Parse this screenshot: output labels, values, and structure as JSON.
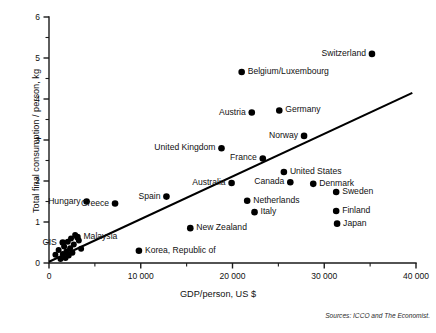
{
  "chart_data": {
    "type": "scatter",
    "title": "",
    "xlabel": "GDP/person, US $",
    "ylabel": "Total final consumption / person, kg",
    "xlim": [
      0,
      40000
    ],
    "ylim": [
      0,
      6
    ],
    "grid": false,
    "legend": "none",
    "x_ticks": [
      0,
      10000,
      20000,
      30000,
      40000
    ],
    "x_tick_labels": [
      "0",
      "10 000",
      "20 000",
      "30 000",
      "40 000"
    ],
    "x_minor_ticks": [
      5000,
      15000,
      25000,
      35000
    ],
    "y_ticks": [
      0,
      1,
      2,
      3,
      4,
      5,
      6
    ],
    "y_tick_labels": [
      "0",
      "1",
      "2",
      "3",
      "4",
      "5",
      "6"
    ],
    "y_minor_ticks": [
      0.5,
      1.5,
      2.5,
      3.5,
      4.5,
      5.5
    ],
    "points": [
      {
        "name": "Switzerland",
        "x": 35200,
        "y": 5.1,
        "label_side": "left"
      },
      {
        "name": "Belgium/Luxembourg",
        "x": 21000,
        "y": 4.66,
        "label_side": "right"
      },
      {
        "name": "Germany",
        "x": 25100,
        "y": 3.72,
        "label_side": "right"
      },
      {
        "name": "Austria",
        "x": 22100,
        "y": 3.67,
        "label_side": "left"
      },
      {
        "name": "Norway",
        "x": 27800,
        "y": 3.1,
        "label_side": "left"
      },
      {
        "name": "United Kingdom",
        "x": 18800,
        "y": 2.8,
        "label_side": "left"
      },
      {
        "name": "France",
        "x": 23300,
        "y": 2.55,
        "label_side": "left"
      },
      {
        "name": "United States",
        "x": 25600,
        "y": 2.22,
        "label_side": "right"
      },
      {
        "name": "Canada",
        "x": 26300,
        "y": 1.97,
        "label_side": "left"
      },
      {
        "name": "Denmark",
        "x": 28800,
        "y": 1.93,
        "label_side": "right"
      },
      {
        "name": "Australia",
        "x": 19900,
        "y": 1.95,
        "label_side": "left"
      },
      {
        "name": "Sweden",
        "x": 31300,
        "y": 1.73,
        "label_side": "right"
      },
      {
        "name": "Netherlands",
        "x": 21600,
        "y": 1.52,
        "label_side": "right"
      },
      {
        "name": "Spain",
        "x": 12800,
        "y": 1.62,
        "label_side": "left"
      },
      {
        "name": "Hungary",
        "x": 4100,
        "y": 1.5,
        "label_side": "left"
      },
      {
        "name": "Greece",
        "x": 7200,
        "y": 1.45,
        "label_side": "left"
      },
      {
        "name": "Italy",
        "x": 22400,
        "y": 1.24,
        "label_side": "right"
      },
      {
        "name": "Finland",
        "x": 31300,
        "y": 1.27,
        "label_side": "right"
      },
      {
        "name": "Japan",
        "x": 31400,
        "y": 0.96,
        "label_side": "right"
      },
      {
        "name": "New Zealand",
        "x": 15400,
        "y": 0.85,
        "label_side": "right"
      },
      {
        "name": "Korea, Republic of",
        "x": 9800,
        "y": 0.3,
        "label_side": "right"
      },
      {
        "name": "Malaysia",
        "x": 3100,
        "y": 0.63,
        "label_side": "right"
      },
      {
        "name": "CIS",
        "x": 1500,
        "y": 0.5,
        "label_side": "left"
      }
    ],
    "unlabeled_points": [
      {
        "x": 700,
        "y": 0.2
      },
      {
        "x": 1050,
        "y": 0.32
      },
      {
        "x": 1250,
        "y": 0.1
      },
      {
        "x": 1500,
        "y": 0.22
      },
      {
        "x": 1650,
        "y": 0.4
      },
      {
        "x": 1800,
        "y": 0.12
      },
      {
        "x": 1900,
        "y": 0.28
      },
      {
        "x": 2050,
        "y": 0.52
      },
      {
        "x": 2150,
        "y": 0.18
      },
      {
        "x": 2300,
        "y": 0.36
      },
      {
        "x": 2400,
        "y": 0.6
      },
      {
        "x": 2550,
        "y": 0.25
      },
      {
        "x": 2700,
        "y": 0.45
      },
      {
        "x": 2850,
        "y": 0.68
      },
      {
        "x": 3250,
        "y": 0.55
      },
      {
        "x": 3500,
        "y": 0.35
      }
    ],
    "trend_line": {
      "x_start": 0,
      "y_start": 0.03,
      "x_end": 39600,
      "y_end": 4.15
    }
  },
  "source_note": "Sources: ICCO and The Economist."
}
